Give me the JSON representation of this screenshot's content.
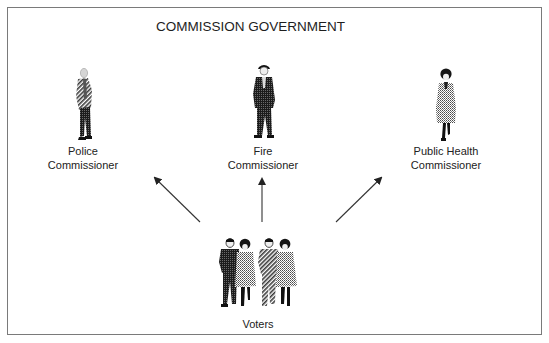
{
  "diagram": {
    "title": "COMMISSION GOVERNMENT",
    "nodes": [
      {
        "id": "police",
        "line1": "Police",
        "line2": "Commissioner",
        "icon": "man-in-light-jacket-icon"
      },
      {
        "id": "fire",
        "line1": "Fire",
        "line2": "Commissioner",
        "icon": "man-in-dark-suit-icon"
      },
      {
        "id": "health",
        "line1": "Public Health",
        "line2": "Commissioner",
        "icon": "woman-in-coat-icon"
      },
      {
        "id": "voters",
        "label": "Voters",
        "icon": "group-of-people-icon"
      }
    ],
    "edges": [
      {
        "from": "voters",
        "to": "police"
      },
      {
        "from": "voters",
        "to": "fire"
      },
      {
        "from": "voters",
        "to": "health"
      }
    ],
    "colors": {
      "border": "#7a7a7a",
      "arrow": "#333333",
      "text": "#222222",
      "dark_fill": "#1c1c1c",
      "light_fill": "#9a9a9a"
    }
  }
}
